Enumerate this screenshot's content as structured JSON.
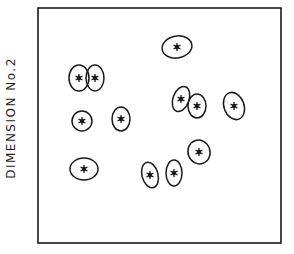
{
  "chart_data": {
    "type": "scatter",
    "title": "",
    "xlabel": "",
    "ylabel": "DIMENSION No.2",
    "frame": {
      "left": 38,
      "top": 8,
      "right": 281,
      "bottom": 243
    },
    "grid": false,
    "legend": null,
    "points": [
      {
        "id": 1,
        "x": 177,
        "y": 47,
        "rx": 15,
        "ry": 11,
        "rot": -10
      },
      {
        "id": 2,
        "x": 79,
        "y": 78,
        "rx": 10,
        "ry": 13,
        "rot": 0
      },
      {
        "id": 3,
        "x": 95,
        "y": 78,
        "rx": 9,
        "ry": 13,
        "rot": 0
      },
      {
        "id": 4,
        "x": 82,
        "y": 121,
        "rx": 10,
        "ry": 10,
        "rot": 0
      },
      {
        "id": 5,
        "x": 121,
        "y": 119,
        "rx": 9,
        "ry": 12,
        "rot": 0
      },
      {
        "id": 6,
        "x": 181,
        "y": 99,
        "rx": 8,
        "ry": 13,
        "rot": 20
      },
      {
        "id": 7,
        "x": 197,
        "y": 106,
        "rx": 9,
        "ry": 12,
        "rot": 0
      },
      {
        "id": 8,
        "x": 234,
        "y": 106,
        "rx": 10,
        "ry": 14,
        "rot": -20
      },
      {
        "id": 9,
        "x": 84,
        "y": 169,
        "rx": 14,
        "ry": 11,
        "rot": 0
      },
      {
        "id": 10,
        "x": 150,
        "y": 175,
        "rx": 8,
        "ry": 13,
        "rot": -15
      },
      {
        "id": 11,
        "x": 174,
        "y": 173,
        "rx": 8,
        "ry": 13,
        "rot": 0
      },
      {
        "id": 12,
        "x": 199,
        "y": 152,
        "rx": 11,
        "ry": 12,
        "rot": -20
      }
    ]
  },
  "labels": {
    "ylabel": "DIMENSION No.2"
  },
  "colors": {
    "ink": "#1a1a1a",
    "background": "#ffffff"
  }
}
